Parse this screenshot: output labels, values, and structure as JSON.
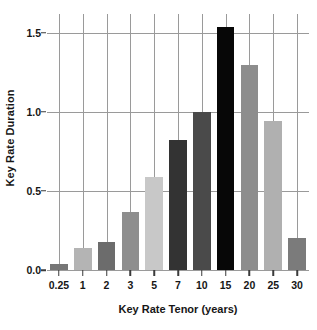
{
  "chart_data": {
    "type": "bar",
    "title": "",
    "xlabel": "Key Rate Tenor (years)",
    "ylabel": "Key Rate Duration",
    "categories": [
      "0.25",
      "1",
      "2",
      "3",
      "5",
      "7",
      "10",
      "15",
      "20",
      "25",
      "30"
    ],
    "values": [
      0.04,
      0.14,
      0.18,
      0.37,
      0.59,
      0.82,
      1.0,
      1.54,
      1.3,
      0.94,
      0.2
    ],
    "bar_colors": [
      "#767676",
      "#b4b4b4",
      "#6c6c6c",
      "#8e8e8e",
      "#c8c8c8",
      "#333333",
      "#4a4a4a",
      "#070707",
      "#8d8d8d",
      "#b0b0b0",
      "#7b7b7b"
    ],
    "ylim": [
      0.0,
      1.62
    ],
    "yticks": [
      0.0,
      0.5,
      1.0,
      1.5
    ],
    "ytick_labels": [
      "0.0",
      "0.5",
      "1.0",
      "1.5"
    ],
    "grid": "both",
    "legend": "none",
    "axis_color": "#9a9a9a",
    "text_color": "#161616"
  }
}
